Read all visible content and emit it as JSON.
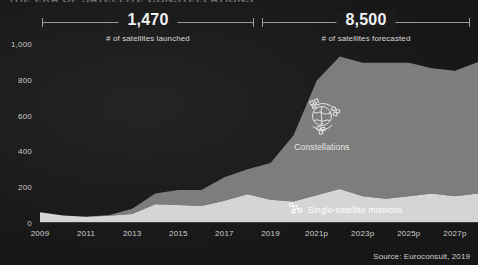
{
  "title": "THE ERA OF SATELLITE CONSTELLATIONS",
  "source": "Source: Euroconsult, 2019",
  "annotations": {
    "launched": {
      "value": "1,470",
      "caption": "# of satellites launched"
    },
    "forecasted": {
      "value": "8,500",
      "caption": "# of satellites forecasted"
    }
  },
  "series_labels": {
    "constellations": "Constellations",
    "single_satellite": "Single-satellite missions"
  },
  "icons": {
    "constellations": "satellite-constellation-globe-icon",
    "single_satellite": "single-satellite-icon"
  },
  "colors": {
    "background": "#191919",
    "constellations": "#7d7d7d",
    "single_satellite": "#d5d5d5",
    "axis": "#3d3d3d",
    "text": "#e8e8e8"
  },
  "chart_data": {
    "type": "area",
    "stacked": true,
    "title": "THE ERA OF SATELLITE CONSTELLATIONS",
    "xlabel": "",
    "ylabel": "",
    "ylim": [
      0,
      1000
    ],
    "yticks": [
      "0",
      "200",
      "400",
      "600",
      "800",
      "1,000"
    ],
    "ytick_values": [
      0,
      200,
      400,
      600,
      800,
      1000
    ],
    "grid": false,
    "legend": "in-chart",
    "x": [
      2009,
      2010,
      2011,
      2012,
      2013,
      2014,
      2015,
      2016,
      2017,
      2018,
      2019,
      2020,
      2021,
      2022,
      2023,
      2024,
      2025,
      2026,
      2027,
      2028
    ],
    "xtick_labels": [
      "2009",
      "2011",
      "2013",
      "2015",
      "2017",
      "2019",
      "2021p",
      "2023p",
      "2025p",
      "2027p"
    ],
    "xtick_values": [
      2009,
      2011,
      2013,
      2015,
      2017,
      2019,
      2021,
      2023,
      2025,
      2027
    ],
    "series": [
      {
        "name": "Single-satellite missions",
        "color": "#d5d5d5",
        "values": [
          60,
          42,
          35,
          40,
          50,
          105,
          100,
          95,
          125,
          160,
          130,
          120,
          155,
          190,
          150,
          135,
          150,
          165,
          150,
          165
        ]
      },
      {
        "name": "Constellations",
        "color": "#7d7d7d",
        "values": [
          0,
          0,
          0,
          5,
          30,
          60,
          85,
          90,
          130,
          140,
          205,
          370,
          640,
          740,
          745,
          760,
          745,
          700,
          700,
          735
        ]
      }
    ],
    "series_totals": [
      60,
      42,
      35,
      45,
      80,
      165,
      185,
      185,
      255,
      300,
      335,
      490,
      795,
      930,
      895,
      895,
      895,
      865,
      850,
      900
    ]
  }
}
